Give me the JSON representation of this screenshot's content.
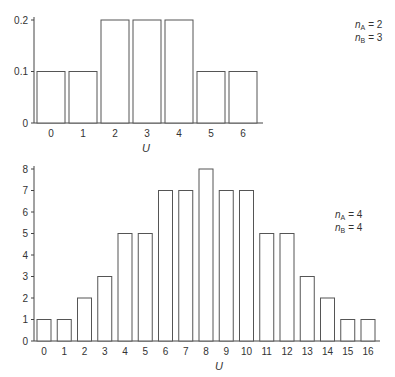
{
  "chart_data": [
    {
      "type": "bar",
      "title": "",
      "xlabel": "U",
      "ylabel": "",
      "categories": [
        "0",
        "1",
        "2",
        "3",
        "4",
        "5",
        "6"
      ],
      "values": [
        0.1,
        0.1,
        0.2,
        0.2,
        0.2,
        0.1,
        0.1
      ],
      "yticks": [
        "0",
        "0.1",
        "0.2"
      ],
      "ylim": [
        0,
        0.2
      ],
      "grid": false,
      "annotation": {
        "line1_var": "n",
        "line1_sub": "A",
        "line1_val": "= 2",
        "line2_var": "n",
        "line2_sub": "B",
        "line2_val": "= 3"
      }
    },
    {
      "type": "bar",
      "title": "",
      "xlabel": "U",
      "ylabel": "",
      "categories": [
        "0",
        "1",
        "2",
        "3",
        "4",
        "5",
        "6",
        "7",
        "8",
        "9",
        "10",
        "11",
        "12",
        "13",
        "14",
        "15",
        "16"
      ],
      "values": [
        1,
        1,
        2,
        3,
        5,
        5,
        7,
        7,
        8,
        7,
        7,
        5,
        5,
        3,
        2,
        1,
        1
      ],
      "yticks": [
        "0",
        "1",
        "2",
        "3",
        "4",
        "5",
        "6",
        "7",
        "8"
      ],
      "ylim": [
        0,
        8
      ],
      "grid": false,
      "annotation": {
        "line1_var": "n",
        "line1_sub": "A",
        "line1_val": "= 4",
        "line2_var": "n",
        "line2_sub": "B",
        "line2_val": "= 4"
      }
    }
  ]
}
